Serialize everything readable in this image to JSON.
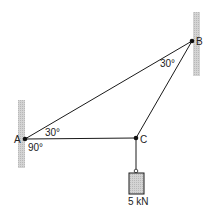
{
  "diagram": {
    "type": "statics-truss",
    "points": {
      "A": {
        "label": "A",
        "x": 25,
        "y": 139
      },
      "B": {
        "label": "B",
        "x": 192,
        "y": 41
      },
      "C": {
        "label": "C",
        "x": 136,
        "y": 138
      }
    },
    "members": [
      {
        "from": "A",
        "to": "B"
      },
      {
        "from": "A",
        "to": "C"
      },
      {
        "from": "B",
        "to": "C"
      }
    ],
    "angles": {
      "A_upper": "30°",
      "A_lower": "90°",
      "B": "30°"
    },
    "load": {
      "label": "5 kN",
      "attached_to": "C"
    },
    "colors": {
      "line": "#1a1a1a",
      "wall_fill": "#cfcfcf",
      "weight_fill": "#bdbdbd"
    }
  }
}
